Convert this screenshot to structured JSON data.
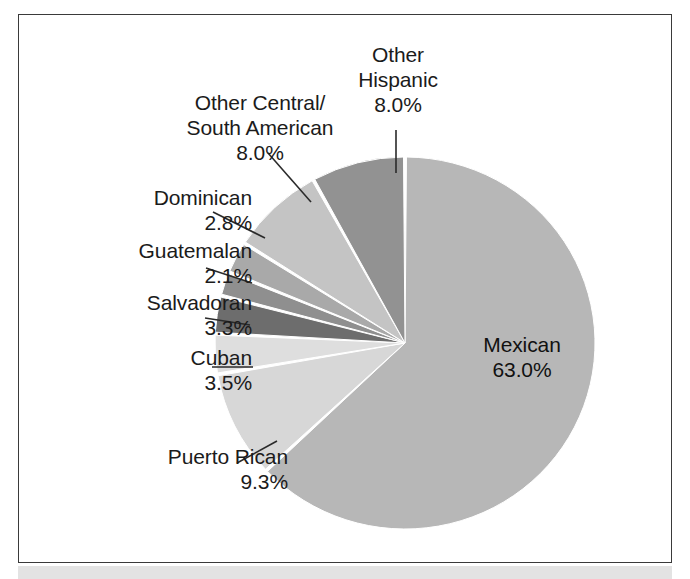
{
  "figure": {
    "background_color": "#ffffff",
    "frame_color": "#3a3a3a",
    "bottom_band_color": "#e3e3e3"
  },
  "chart_data": {
    "type": "pie",
    "title": "",
    "subtitle": "",
    "xlabel": "",
    "ylabel": "",
    "legend_position": "none",
    "labels_position": "outside-with-leader-lines",
    "start_angle_deg": 0,
    "direction": "clockwise",
    "categories": [
      "Mexican",
      "Puerto Rican",
      "Cuban",
      "Salvadoran",
      "Guatemalan",
      "Dominican",
      "Other Central/South American",
      "Other Hispanic"
    ],
    "values": [
      63.0,
      9.3,
      3.5,
      3.3,
      2.1,
      2.8,
      8.0,
      8.0
    ],
    "value_labels": [
      "63.0%",
      "9.3%",
      "3.5%",
      "3.3%",
      "2.1%",
      "2.8%",
      "8.0%",
      "8.0%"
    ],
    "units": "percent",
    "slice_colors": [
      "#b7b7b7",
      "#d7d7d7",
      "#dedede",
      "#6d6d6d",
      "#8f8f8f",
      "#a9a9a9",
      "#c4c4c4",
      "#929292"
    ],
    "separator_color": "#ffffff",
    "total": 100.0
  },
  "labels": [
    {
      "id": "other-hispanic",
      "name": "Other\nHispanic",
      "line1": "Other",
      "line2": "Hispanic",
      "pct": "8.0%"
    },
    {
      "id": "other-csa",
      "line1": "Other Central/",
      "line2": "South American",
      "pct": "8.0%"
    },
    {
      "id": "dominican",
      "line1": "Dominican",
      "pct": "2.8%"
    },
    {
      "id": "guatemalan",
      "line1": "Guatemalan",
      "pct": "2.1%"
    },
    {
      "id": "salvadoran",
      "line1": "Salvadoran",
      "pct": "3.3%"
    },
    {
      "id": "cuban",
      "line1": "Cuban",
      "pct": "3.5%"
    },
    {
      "id": "puerto-rican",
      "line1": "Puerto Rican",
      "pct": "9.3%"
    },
    {
      "id": "mexican",
      "line1": "Mexican",
      "pct": "63.0%"
    }
  ],
  "text": {
    "other_hispanic_l1": "Other",
    "other_hispanic_l2": "Hispanic",
    "other_hispanic_pct": "8.0%",
    "other_csa_l1": "Other Central/",
    "other_csa_l2": "South American",
    "other_csa_pct": "8.0%",
    "dominican_name": "Dominican",
    "dominican_pct": "2.8%",
    "guatemalan_name": "Guatemalan",
    "guatemalan_pct": "2.1%",
    "salvadoran_name": "Salvadoran",
    "salvadoran_pct": "3.3%",
    "cuban_name": "Cuban",
    "cuban_pct": "3.5%",
    "puerto_rican_name": "Puerto Rican",
    "puerto_rican_pct": "9.3%",
    "mexican_name": "Mexican",
    "mexican_pct": "63.0%"
  }
}
